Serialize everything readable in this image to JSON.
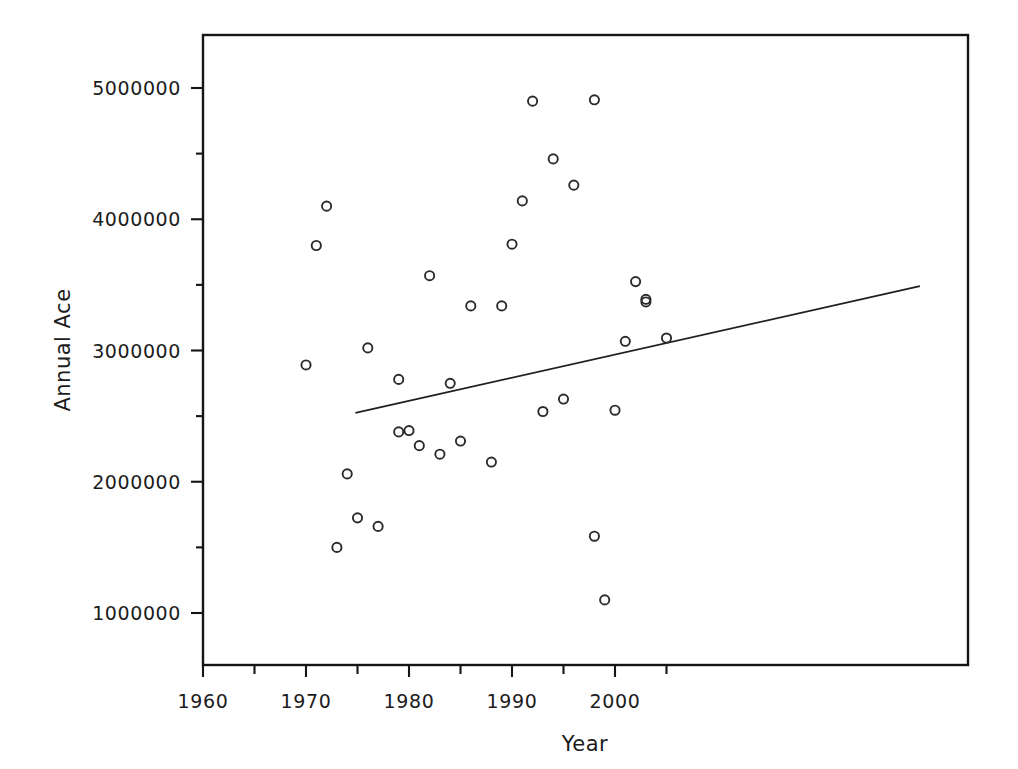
{
  "chart_data": {
    "type": "scatter",
    "title": "",
    "xlabel": "Year",
    "ylabel": "Annual Ace",
    "xlim": [
      1960,
      2007
    ],
    "ylim": [
      700000,
      5400000
    ],
    "grid": false,
    "legend": null,
    "x_ticks_major": [
      1960,
      1970,
      1980,
      1990,
      2000
    ],
    "x_tick_labels": [
      "1960",
      "1970",
      "1980",
      "1990",
      "2000"
    ],
    "x_ticks_minor": [
      1965,
      1975,
      1985,
      1995,
      2005
    ],
    "y_ticks_major": [
      1000000,
      2000000,
      3000000,
      4000000,
      5000000
    ],
    "y_tick_labels": [
      "1000000",
      "2000000",
      "3000000",
      "4000000",
      "5000000"
    ],
    "y_ticks_minor": [
      1500000,
      2500000,
      3500000,
      4500000
    ],
    "marker_style": "open-circle",
    "series": [
      {
        "name": "Annual Ace",
        "x": [
          1970,
          1971,
          1972,
          1973,
          1974,
          1975,
          1976,
          1977,
          1979,
          1979,
          1980,
          1981,
          1982,
          1983,
          1984,
          1985,
          1986,
          1988,
          1989,
          1990,
          1991,
          1992,
          1993,
          1994,
          1995,
          1996,
          1998,
          1998,
          1999,
          2000,
          2001,
          2002,
          2003,
          2003,
          2005
        ],
        "y": [
          2890000,
          3800000,
          4100000,
          1500000,
          2060000,
          1725000,
          3020000,
          1660000,
          2380000,
          2780000,
          2390000,
          2275000,
          3570000,
          2210000,
          2750000,
          2310000,
          3340000,
          2150000,
          3340000,
          3810000,
          4140000,
          4900000,
          2535000,
          4460000,
          2630000,
          4260000,
          1585000,
          4910000,
          1100000,
          2545000,
          3070000,
          3525000,
          3370000,
          3390000,
          3095000
        ]
      }
    ],
    "trendline": {
      "type": "linear-fit",
      "x_start": 1974.8,
      "y_start": 2525000,
      "x_end": 2029.6,
      "y_end": 3490000
    }
  }
}
